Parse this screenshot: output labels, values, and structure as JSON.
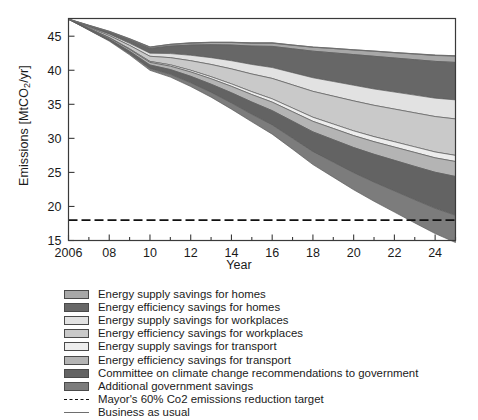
{
  "chart_data": {
    "type": "area",
    "title": "",
    "xlabel": "Year",
    "ylabel": "Emissions [MtCO2/yr]",
    "ylabel_prefix": "Emissions [MtCO",
    "ylabel_sub": "2",
    "ylabel_suffix": "/yr]",
    "xlim": [
      2006,
      2025
    ],
    "ylim": [
      15,
      47.6
    ],
    "grid": false,
    "legend_position": "below-plot",
    "x": [
      2006,
      2007,
      2008,
      2009,
      2010,
      2011,
      2012,
      2013,
      2014,
      2015,
      2016,
      2017,
      2018,
      2019,
      2020,
      2021,
      2022,
      2023,
      2024,
      2025
    ],
    "xticks": [
      2006,
      2008,
      2010,
      2012,
      2014,
      2016,
      2018,
      2020,
      2022,
      2024
    ],
    "xticklabels": [
      "2006",
      "08",
      "10",
      "12",
      "14",
      "16",
      "18",
      "20",
      "22",
      "24"
    ],
    "yticks": [
      15,
      20,
      25,
      30,
      35,
      40,
      45
    ],
    "yticklabels": [
      "15",
      "20",
      "25",
      "30",
      "35",
      "40",
      "45"
    ],
    "business_as_usual": {
      "name": "Business as usual",
      "color": "#6e6e6e",
      "values": [
        47.5,
        46.6,
        45.7,
        44.6,
        43.4,
        43.8,
        44.0,
        44.1,
        44.1,
        44.0,
        44.0,
        43.7,
        43.4,
        43.2,
        43.0,
        42.8,
        42.6,
        42.4,
        42.2,
        42.1
      ]
    },
    "target_line": {
      "name": "Mayor's 60% Co2 emissions reduction target",
      "value": 18.0,
      "style": "dash-dot",
      "color": "#111111"
    },
    "series": [
      {
        "name": "Energy supply savings for homes",
        "color": "#a8a8a8",
        "values": [
          0.0,
          0.05,
          0.1,
          0.15,
          0.2,
          0.25,
          0.3,
          0.35,
          0.4,
          0.45,
          0.5,
          0.55,
          0.6,
          0.65,
          0.7,
          0.75,
          0.8,
          0.85,
          0.9,
          0.95
        ]
      },
      {
        "name": "Energy efficiency savings for homes",
        "color": "#676767",
        "values": [
          0.0,
          0.15,
          0.3,
          0.5,
          0.7,
          1.1,
          1.5,
          1.9,
          2.3,
          2.7,
          3.1,
          3.5,
          3.9,
          4.2,
          4.5,
          4.8,
          5.0,
          5.2,
          5.4,
          5.5
        ]
      },
      {
        "name": "Energy supply savings for workplaces",
        "color": "#e2e2e2",
        "values": [
          0.0,
          0.1,
          0.2,
          0.3,
          0.45,
          0.6,
          0.8,
          1.0,
          1.2,
          1.4,
          1.6,
          1.8,
          2.0,
          2.15,
          2.3,
          2.4,
          2.5,
          2.6,
          2.7,
          2.8
        ]
      },
      {
        "name": "Energy efficiency savings for workplaces",
        "color": "#c9c9c9",
        "values": [
          0.0,
          0.15,
          0.3,
          0.5,
          0.75,
          1.05,
          1.4,
          1.8,
          2.2,
          2.6,
          3.0,
          3.4,
          3.8,
          4.1,
          4.4,
          4.6,
          4.8,
          5.0,
          5.2,
          5.35
        ]
      },
      {
        "name": "Energy supply savings for transport",
        "color": "#ededed",
        "values": [
          0.0,
          0.03,
          0.06,
          0.1,
          0.15,
          0.2,
          0.25,
          0.3,
          0.36,
          0.42,
          0.48,
          0.54,
          0.6,
          0.65,
          0.7,
          0.74,
          0.78,
          0.82,
          0.86,
          0.9
        ]
      },
      {
        "name": "Energy efficiency savings for transport",
        "color": "#b4b4b4",
        "values": [
          0.0,
          0.08,
          0.16,
          0.26,
          0.38,
          0.5,
          0.64,
          0.8,
          0.95,
          1.1,
          1.25,
          1.4,
          1.55,
          1.65,
          1.75,
          1.85,
          1.95,
          2.05,
          2.12,
          2.2
        ]
      },
      {
        "name": "Committee on climate change recommendations to government",
        "color": "#636363",
        "values": [
          0.0,
          0.1,
          0.2,
          0.35,
          0.5,
          0.7,
          0.95,
          1.2,
          1.5,
          1.8,
          2.1,
          2.5,
          2.9,
          3.3,
          3.7,
          4.1,
          4.5,
          4.9,
          5.3,
          5.7
        ]
      },
      {
        "name": "Additional government savings",
        "color": "#7c7c7c",
        "values": [
          0.0,
          0.05,
          0.1,
          0.18,
          0.28,
          0.4,
          0.55,
          0.7,
          0.9,
          1.1,
          1.35,
          1.6,
          1.9,
          2.2,
          2.5,
          2.8,
          3.1,
          3.4,
          3.7,
          4.0
        ]
      }
    ],
    "legend_entries": [
      {
        "label": "Energy supply savings for homes",
        "swatch": "#a8a8a8",
        "kind": "area"
      },
      {
        "label": "Energy efficiency savings for homes",
        "swatch": "#676767",
        "kind": "area"
      },
      {
        "label": "Energy supply savings for workplaces",
        "swatch": "#e2e2e2",
        "kind": "area"
      },
      {
        "label": "Energy efficiency savings for workplaces",
        "swatch": "#c9c9c9",
        "kind": "area"
      },
      {
        "label": "Energy supply savings for transport",
        "swatch": "#ededed",
        "kind": "area"
      },
      {
        "label": "Energy efficiency savings for transport",
        "swatch": "#b4b4b4",
        "kind": "area"
      },
      {
        "label": "Committee on climate change recommendations to government",
        "swatch": "#636363",
        "kind": "area"
      },
      {
        "label": "Additional government savings",
        "swatch": "#7c7c7c",
        "kind": "area"
      },
      {
        "label": "Mayor's 60% Co2 emissions reduction target",
        "swatch": "#111111",
        "kind": "dashdot"
      },
      {
        "label": "Business as usual",
        "swatch": "#6e6e6e",
        "kind": "solid"
      }
    ]
  }
}
